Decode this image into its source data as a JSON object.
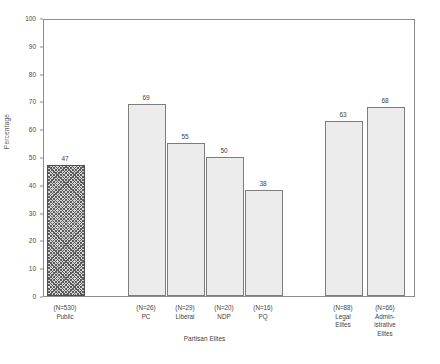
{
  "chart_data": {
    "type": "bar",
    "title": "",
    "xlabel": "Partisan Elites",
    "ylabel": "Percentage",
    "ylim": [
      0,
      100
    ],
    "ytick_step": 10,
    "yticks": [
      "100",
      "90",
      "80",
      "70",
      "60",
      "50",
      "40",
      "30",
      "20",
      "10",
      "0"
    ],
    "grid": false,
    "legend": "none",
    "categories": [
      "Public",
      "PC",
      "Liberal",
      "NDP",
      "PQ",
      "Legal\nElites",
      "Admin-\nistrative\nElites"
    ],
    "n_labels": [
      "(N=530)",
      "(N=26)",
      "(N=29)",
      "(N=20)",
      "(N=16)",
      "(N=88)",
      "(N=66)"
    ],
    "values": [
      47,
      69,
      55,
      50,
      38,
      63,
      68
    ],
    "value_labels": [
      "47",
      "69",
      "55",
      "50",
      "38",
      "63",
      "68"
    ],
    "bar_styles": [
      "hatched",
      "solid",
      "solid",
      "solid",
      "solid",
      "solid",
      "solid"
    ],
    "colors": {
      "bar_fill": "#ececec",
      "bar_stroke": "#7d7d7d",
      "hatch_fill": "#d6d6d6",
      "hatch_stroke": "#5d5d5d",
      "axis": "#8c8c8c",
      "text": "#3f3f3f",
      "background": "#ffffff"
    }
  }
}
